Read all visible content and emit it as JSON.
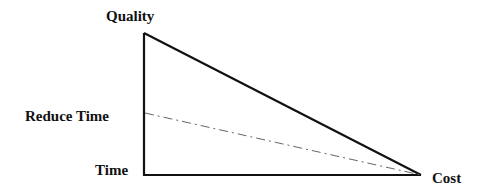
{
  "diagram": {
    "type": "right-triangle tradeoff diagram",
    "labels": {
      "quality": "Quality",
      "reduce_time": "Reduce Time",
      "time": "Time",
      "cost": "Cost"
    },
    "colors": {
      "line": "#111111",
      "dashed_line": "#666666",
      "background": "#ffffff"
    },
    "lines": [
      {
        "name": "vertical-axis",
        "style": "solid",
        "from": "Time",
        "to": "Quality"
      },
      {
        "name": "horizontal-axis",
        "style": "solid",
        "from": "Time",
        "to": "Cost"
      },
      {
        "name": "hypotenuse",
        "style": "solid",
        "from": "Quality",
        "to": "Cost"
      },
      {
        "name": "reduce-time-line",
        "style": "dash-dot",
        "from": "Reduce Time",
        "to": "Cost"
      }
    ]
  }
}
